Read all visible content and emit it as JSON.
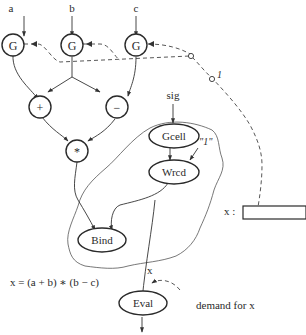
{
  "diagram": {
    "inputs": {
      "a": "a",
      "b": "b",
      "c": "c",
      "sig": "sig"
    },
    "nodes": {
      "g_a": "G",
      "g_b": "G",
      "g_c": "G",
      "plus": "+",
      "minus": "−",
      "times": "*",
      "gcell": "Gcell",
      "wrcd": "Wrcd",
      "bind": "Bind",
      "eval": "Eval"
    },
    "labels": {
      "one_quoted": "\"1\"",
      "one": "1",
      "x_edge": "x",
      "x_storage": "x :",
      "formula": "x = (a + b) ∗ (b − c)",
      "demand": "demand for  x"
    },
    "colors": {
      "stroke": "#2a2a2a",
      "background": "#ffffff"
    }
  }
}
